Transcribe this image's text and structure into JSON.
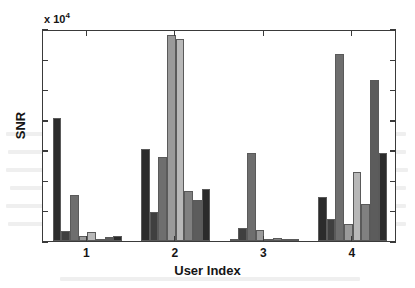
{
  "chart_data": {
    "type": "bar",
    "title": "",
    "xlabel": "User Index",
    "ylabel": "SNR",
    "y_multiplier_text": "x 10",
    "y_multiplier_exponent": "4",
    "y_scale": 10000,
    "categories": [
      "1",
      "2",
      "3",
      "4"
    ],
    "xtick_labels": [
      "1",
      "2",
      "3",
      "4"
    ],
    "ytick_labels": [
      "0",
      "1",
      "2",
      "3",
      "4",
      "5",
      "6",
      "7"
    ],
    "ytick_values": [
      0,
      1,
      2,
      3,
      4,
      5,
      6,
      7
    ],
    "ylim": [
      0,
      7
    ],
    "grid": false,
    "legend": "none",
    "bars_per_group": 7,
    "series": [
      {
        "name": "series-1",
        "color": "#2b2b2b",
        "values": [
          4.05,
          3.03,
          0.04,
          1.46
        ]
      },
      {
        "name": "series-2",
        "color": "#3f3f3f",
        "values": [
          0.33,
          0.95,
          0.42,
          0.74
        ]
      },
      {
        "name": "series-3",
        "color": "#6e6e6e",
        "values": [
          1.53,
          2.77,
          2.92,
          6.18
        ]
      },
      {
        "name": "series-4",
        "color": "#9a9a9a",
        "values": [
          0.15,
          6.8,
          0.35,
          0.56
        ]
      },
      {
        "name": "series-5",
        "color": "#b8b8b8",
        "values": [
          0.29,
          6.66,
          0.08,
          2.27
        ]
      },
      {
        "name": "series-6",
        "color": "#808080",
        "values": [
          0.05,
          1.66,
          0.1,
          1.23
        ]
      },
      {
        "name": "series-7",
        "color": "#5c5c5c",
        "values": [
          0.14,
          1.36,
          0.05,
          5.33
        ]
      },
      {
        "name": "series-8",
        "color": "#2b2b2b",
        "values": [
          0.17,
          1.73,
          0.07,
          2.92
        ]
      }
    ]
  }
}
